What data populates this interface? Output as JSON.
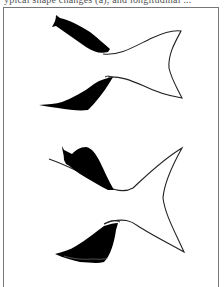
{
  "caption": {
    "text": "ypical shape changes (a), and longitudinal ...",
    "cropped": true
  },
  "figure": {
    "panels": [
      {
        "name": "upper-tail",
        "fins": [
          "upper-fin-dorsal",
          "upper-fin-ventral"
        ]
      },
      {
        "name": "lower-tail",
        "fins": [
          "lower-fin-dorsal",
          "lower-fin-ventral"
        ]
      }
    ],
    "colors": {
      "fill": "#000000",
      "outline": "#222222",
      "frame": "#777777",
      "background": "#ffffff"
    }
  }
}
